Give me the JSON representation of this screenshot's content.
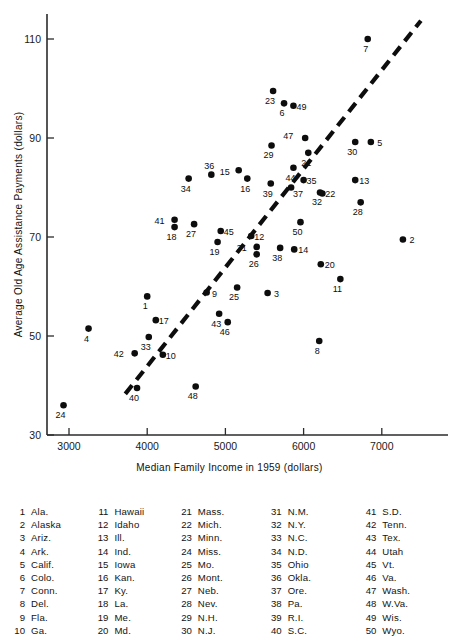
{
  "chart_data": {
    "type": "scatter",
    "title": "",
    "xlabel": "Median Family Income in 1959 (dollars)",
    "ylabel": "Average Old Age Assistance Payments (dollars)",
    "xlim": [
      2650,
      7500
    ],
    "ylim": [
      30,
      115
    ],
    "xticks": [
      3000,
      4000,
      5000,
      6000,
      7000
    ],
    "yticks": [
      30,
      50,
      70,
      90,
      110
    ],
    "grid": false,
    "legend_position": "below-plot",
    "trend_line": {
      "style": "dashed",
      "x": [
        3720,
        7500
      ],
      "y": [
        38.3,
        113.7
      ]
    },
    "points": [
      {
        "id": 1,
        "label": "1",
        "state": "Ala.",
        "x": 4000,
        "y": 58.0,
        "lx": -2,
        "ly": 13
      },
      {
        "id": 2,
        "label": "2",
        "state": "Alaska",
        "x": 7270,
        "y": 69.5,
        "lx": 9,
        "ly": 4
      },
      {
        "id": 3,
        "label": "3",
        "state": "Ariz.",
        "x": 5540,
        "y": 58.7,
        "lx": 9,
        "ly": 4
      },
      {
        "id": 4,
        "label": "4",
        "state": "Ark.",
        "x": 3250,
        "y": 51.5,
        "lx": -2,
        "ly": 13
      },
      {
        "id": 5,
        "label": "5",
        "state": "Calif.",
        "x": 6860,
        "y": 89.2,
        "lx": 9,
        "ly": 4
      },
      {
        "id": 6,
        "label": "6",
        "state": "Colo.",
        "x": 5750,
        "y": 97.0,
        "lx": -2,
        "ly": 13
      },
      {
        "id": 7,
        "label": "7",
        "state": "Conn.",
        "x": 6820,
        "y": 110.0,
        "lx": -2,
        "ly": 13
      },
      {
        "id": 8,
        "label": "8",
        "state": "Del.",
        "x": 6200,
        "y": 49.0,
        "lx": -2,
        "ly": 13
      },
      {
        "id": 9,
        "label": "9",
        "state": "Fla.",
        "x": 4760,
        "y": 58.8,
        "lx": 8,
        "ly": 5
      },
      {
        "id": 10,
        "label": "10",
        "state": "Ga.",
        "x": 4200,
        "y": 46.2,
        "lx": 8,
        "ly": 4
      },
      {
        "id": 11,
        "label": "11",
        "state": "Hawaii",
        "x": 6470,
        "y": 61.5,
        "lx": -3,
        "ly": 13
      },
      {
        "id": 12,
        "label": "12",
        "state": "Idaho",
        "x": 5330,
        "y": 70.2,
        "lx": 8,
        "ly": 4
      },
      {
        "id": 13,
        "label": "13",
        "state": "Ill.",
        "x": 6660,
        "y": 81.5,
        "lx": 9,
        "ly": 4
      },
      {
        "id": 14,
        "label": "14",
        "state": "Ind.",
        "x": 5880,
        "y": 67.5,
        "lx": 9,
        "ly": 4
      },
      {
        "id": 15,
        "label": "15",
        "state": "Iowa",
        "x": 5170,
        "y": 83.5,
        "lx": -14,
        "ly": 5
      },
      {
        "id": 16,
        "label": "16",
        "state": "Kan.",
        "x": 5280,
        "y": 81.8,
        "lx": -2,
        "ly": 13
      },
      {
        "id": 17,
        "label": "17",
        "state": "Ky.",
        "x": 4110,
        "y": 53.2,
        "lx": 8,
        "ly": 4
      },
      {
        "id": 18,
        "label": "18",
        "state": "La.",
        "x": 4350,
        "y": 72.0,
        "lx": -3,
        "ly": 13
      },
      {
        "id": 19,
        "label": "19",
        "state": "Me.",
        "x": 4900,
        "y": 69.0,
        "lx": -3,
        "ly": 13
      },
      {
        "id": 20,
        "label": "20",
        "state": "Md.",
        "x": 6220,
        "y": 64.5,
        "lx": 9,
        "ly": 4
      },
      {
        "id": 21,
        "label": "21",
        "state": "Mass.",
        "x": 6060,
        "y": 87.0,
        "lx": -2,
        "ly": 13
      },
      {
        "id": 22,
        "label": "22",
        "state": "Mich.",
        "x": 6240,
        "y": 78.8,
        "lx": 8,
        "ly": 4
      },
      {
        "id": 23,
        "label": "23",
        "state": "Minn.",
        "x": 5610,
        "y": 99.5,
        "lx": -3,
        "ly": 13
      },
      {
        "id": 24,
        "label": "24",
        "state": "Miss.",
        "x": 2930,
        "y": 36.0,
        "lx": -3,
        "ly": 13
      },
      {
        "id": 25,
        "label": "25",
        "state": "Mo.",
        "x": 5150,
        "y": 59.8,
        "lx": -3,
        "ly": 13
      },
      {
        "id": 26,
        "label": "26",
        "state": "Mont.",
        "x": 5400,
        "y": 66.5,
        "lx": -3,
        "ly": 13
      },
      {
        "id": 27,
        "label": "27",
        "state": "Neb.",
        "x": 4600,
        "y": 72.6,
        "lx": -3,
        "ly": 13
      },
      {
        "id": 28,
        "label": "28",
        "state": "Nev.",
        "x": 6730,
        "y": 77.0,
        "lx": -3,
        "ly": 13
      },
      {
        "id": 29,
        "label": "29",
        "state": "N.H.",
        "x": 5590,
        "y": 88.5,
        "lx": -3,
        "ly": 13
      },
      {
        "id": 30,
        "label": "30",
        "state": "N.J.",
        "x": 6660,
        "y": 89.2,
        "lx": -3,
        "ly": 13
      },
      {
        "id": 31,
        "label": "31",
        "state": "N.M.",
        "x": 5400,
        "y": 68.0,
        "lx": -15,
        "ly": 4
      },
      {
        "id": 32,
        "label": "32",
        "state": "N.Y.",
        "x": 6210,
        "y": 79.0,
        "lx": -3,
        "ly": 13
      },
      {
        "id": 33,
        "label": "33",
        "state": "N.C.",
        "x": 4020,
        "y": 49.8,
        "lx": -3,
        "ly": 13
      },
      {
        "id": 34,
        "label": "34",
        "state": "N.D.",
        "x": 4530,
        "y": 81.8,
        "lx": -3,
        "ly": 13
      },
      {
        "id": 35,
        "label": "35",
        "state": "Ohio",
        "x": 6000,
        "y": 81.5,
        "lx": 8,
        "ly": 4
      },
      {
        "id": 36,
        "label": "36",
        "state": "Okla.",
        "x": 4820,
        "y": 82.6,
        "lx": -2,
        "ly": -6
      },
      {
        "id": 37,
        "label": "37",
        "state": "Ore.",
        "x": 5840,
        "y": 80.0,
        "lx": 7,
        "ly": 9
      },
      {
        "id": 38,
        "label": "38",
        "state": "Pa.",
        "x": 5700,
        "y": 67.8,
        "lx": -3,
        "ly": 13
      },
      {
        "id": 39,
        "label": "39",
        "state": "R.I.",
        "x": 5580,
        "y": 80.8,
        "lx": -3,
        "ly": 13
      },
      {
        "id": 40,
        "label": "40",
        "state": "S.C.",
        "x": 3870,
        "y": 39.5,
        "lx": -3,
        "ly": 13
      },
      {
        "id": 41,
        "label": "41",
        "state": "S.D.",
        "x": 4350,
        "y": 73.5,
        "lx": -15,
        "ly": 4
      },
      {
        "id": 42,
        "label": "42",
        "state": "Tenn.",
        "x": 3840,
        "y": 46.5,
        "lx": -16,
        "ly": 4
      },
      {
        "id": 43,
        "label": "43",
        "state": "Tex.",
        "x": 4920,
        "y": 54.5,
        "lx": -3,
        "ly": 13
      },
      {
        "id": 44,
        "label": "44",
        "state": "Utah",
        "x": 5870,
        "y": 84.0,
        "lx": -3,
        "ly": 13
      },
      {
        "id": 45,
        "label": "45",
        "state": "Vt.",
        "x": 4940,
        "y": 71.2,
        "lx": 8,
        "ly": 4
      },
      {
        "id": 46,
        "label": "46",
        "state": "Va.",
        "x": 5030,
        "y": 52.8,
        "lx": -3,
        "ly": 13
      },
      {
        "id": 47,
        "label": "47",
        "state": "Wash.",
        "x": 6020,
        "y": 90.0,
        "lx": -17,
        "ly": 1
      },
      {
        "id": 48,
        "label": "48",
        "state": "W.Va.",
        "x": 4620,
        "y": 39.8,
        "lx": -3,
        "ly": 13
      },
      {
        "id": 49,
        "label": "49",
        "state": "Wis.",
        "x": 5870,
        "y": 96.5,
        "lx": 8,
        "ly": 4
      },
      {
        "id": 50,
        "label": "50",
        "state": "Wyo.",
        "x": 5960,
        "y": 73.0,
        "lx": -3,
        "ly": 13
      }
    ]
  },
  "axes": {
    "x_title": "Median Family Income in 1959 (dollars)",
    "y_title": "Average Old Age Assistance Payments (dollars)",
    "x_tick_labels": [
      "3000",
      "4000",
      "5000",
      "6000",
      "7000"
    ],
    "y_tick_labels": [
      "30",
      "50",
      "70",
      "90",
      "110"
    ]
  },
  "legend": {
    "columns": [
      [
        {
          "num": "1",
          "name": "Ala."
        },
        {
          "num": "2",
          "name": "Alaska"
        },
        {
          "num": "3",
          "name": "Ariz."
        },
        {
          "num": "4",
          "name": "Ark."
        },
        {
          "num": "5",
          "name": "Calif."
        },
        {
          "num": "6",
          "name": "Colo."
        },
        {
          "num": "7",
          "name": "Conn."
        },
        {
          "num": "8",
          "name": "Del."
        },
        {
          "num": "9",
          "name": "Fla."
        },
        {
          "num": "10",
          "name": "Ga."
        }
      ],
      [
        {
          "num": "11",
          "name": "Hawaii"
        },
        {
          "num": "12",
          "name": "Idaho"
        },
        {
          "num": "13",
          "name": "Ill."
        },
        {
          "num": "14",
          "name": "Ind."
        },
        {
          "num": "15",
          "name": "Iowa"
        },
        {
          "num": "16",
          "name": "Kan."
        },
        {
          "num": "17",
          "name": "Ky."
        },
        {
          "num": "18",
          "name": "La."
        },
        {
          "num": "19",
          "name": "Me."
        },
        {
          "num": "20",
          "name": "Md."
        }
      ],
      [
        {
          "num": "21",
          "name": "Mass."
        },
        {
          "num": "22",
          "name": "Mich."
        },
        {
          "num": "23",
          "name": "Minn."
        },
        {
          "num": "24",
          "name": "Miss."
        },
        {
          "num": "25",
          "name": "Mo."
        },
        {
          "num": "26",
          "name": "Mont."
        },
        {
          "num": "27",
          "name": "Neb."
        },
        {
          "num": "28",
          "name": "Nev."
        },
        {
          "num": "29",
          "name": "N.H."
        },
        {
          "num": "30",
          "name": "N.J."
        }
      ],
      [
        {
          "num": "31",
          "name": "N.M."
        },
        {
          "num": "32",
          "name": "N.Y."
        },
        {
          "num": "33",
          "name": "N.C."
        },
        {
          "num": "34",
          "name": "N.D."
        },
        {
          "num": "35",
          "name": "Ohio"
        },
        {
          "num": "36",
          "name": "Okla."
        },
        {
          "num": "37",
          "name": "Ore."
        },
        {
          "num": "38",
          "name": "Pa."
        },
        {
          "num": "39",
          "name": "R.I."
        },
        {
          "num": "40",
          "name": "S.C."
        }
      ],
      [
        {
          "num": "41",
          "name": "S.D."
        },
        {
          "num": "42",
          "name": "Tenn."
        },
        {
          "num": "43",
          "name": "Tex."
        },
        {
          "num": "44",
          "name": "Utah"
        },
        {
          "num": "45",
          "name": "Vt."
        },
        {
          "num": "46",
          "name": "Va."
        },
        {
          "num": "47",
          "name": "Wash."
        },
        {
          "num": "48",
          "name": "W.Va."
        },
        {
          "num": "49",
          "name": "Wis."
        },
        {
          "num": "50",
          "name": "Wyo."
        }
      ]
    ]
  },
  "colors": {
    "marker": "#0d0d0d",
    "axis": "#2b2b2b",
    "background": "#ffffff"
  }
}
